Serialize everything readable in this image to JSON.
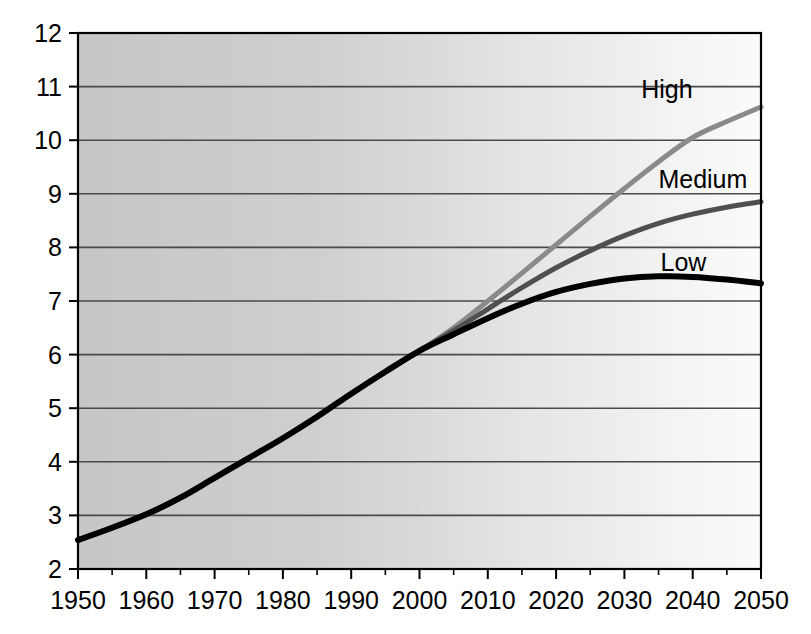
{
  "chart_data": {
    "type": "line",
    "title": "",
    "subtitle": "",
    "xlabel": "",
    "ylabel": "",
    "xlim": [
      1950,
      2050
    ],
    "ylim": [
      2,
      12
    ],
    "grid": true,
    "grid_axis": "y",
    "legend_position": "inline-right",
    "plot_background": "gradient-gray-left-to-white-right",
    "x_ticks": [
      1950,
      1960,
      1970,
      1980,
      1990,
      2000,
      2010,
      2020,
      2030,
      2040,
      2050
    ],
    "x_minor_tick_interval": 5,
    "y_ticks": [
      2,
      3,
      4,
      5,
      6,
      7,
      8,
      9,
      10,
      11,
      12
    ],
    "x": [
      1950,
      1955,
      1960,
      1965,
      1970,
      1975,
      1980,
      1985,
      1990,
      1995,
      2000,
      2005,
      2010,
      2015,
      2020,
      2025,
      2030,
      2035,
      2040,
      2045,
      2050
    ],
    "series": [
      {
        "name": "High",
        "color": "#8a8a8a",
        "line_width": 5,
        "values": [
          2.54,
          2.77,
          3.02,
          3.33,
          3.7,
          4.07,
          4.44,
          4.84,
          5.27,
          5.68,
          6.07,
          6.5,
          7.0,
          7.52,
          8.05,
          8.58,
          9.1,
          9.6,
          10.05,
          10.35,
          10.62
        ]
      },
      {
        "name": "Medium",
        "color": "#4f4f4f",
        "line_width": 5,
        "values": [
          2.54,
          2.77,
          3.02,
          3.33,
          3.7,
          4.07,
          4.44,
          4.84,
          5.27,
          5.68,
          6.07,
          6.45,
          6.85,
          7.25,
          7.62,
          7.94,
          8.22,
          8.45,
          8.62,
          8.75,
          8.85
        ]
      },
      {
        "name": "Low",
        "color": "#000000",
        "line_width": 6,
        "values": [
          2.54,
          2.77,
          3.02,
          3.33,
          3.7,
          4.07,
          4.44,
          4.84,
          5.27,
          5.68,
          6.07,
          6.38,
          6.68,
          6.95,
          7.17,
          7.32,
          7.42,
          7.46,
          7.45,
          7.4,
          7.33
        ]
      }
    ],
    "series_label_anchors": [
      {
        "name": "High",
        "x": 2040,
        "y": 10.95
      },
      {
        "name": "Medium",
        "x": 2048,
        "y": 9.28
      },
      {
        "name": "Low",
        "x": 2042,
        "y": 7.72
      }
    ]
  },
  "axes": {
    "y_tick_labels": [
      "12",
      "11",
      "10",
      "9",
      "8",
      "7",
      "6",
      "5",
      "4",
      "3",
      "2"
    ],
    "x_tick_labels": [
      "1950",
      "1960",
      "1970",
      "1980",
      "1990",
      "2000",
      "2010",
      "2020",
      "2030",
      "2040",
      "2050"
    ]
  },
  "legend": {
    "entries": [
      "High",
      "Medium",
      "Low"
    ]
  },
  "colors": {
    "axis": "#000000",
    "gridline": "#4a4a4a",
    "plot_fill_left": "#c9c9c9",
    "plot_fill_right": "#fafafa",
    "high": "#8a8a8a",
    "medium": "#4f4f4f",
    "low": "#000000"
  }
}
